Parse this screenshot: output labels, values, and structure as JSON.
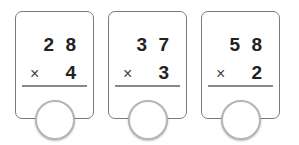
{
  "problems": [
    {
      "top": "2 8",
      "operator": "×",
      "bottom": "4"
    },
    {
      "top": "3 7",
      "operator": "×",
      "bottom": "3"
    },
    {
      "top": "5 8",
      "operator": "×",
      "bottom": "2"
    }
  ]
}
